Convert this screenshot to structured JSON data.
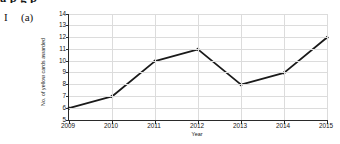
{
  "page": {
    "question_number": "I",
    "question_part": "(a)",
    "top_cut_text": "a  p  g             p"
  },
  "chart_data": {
    "type": "line",
    "title": "",
    "xlabel": "Year",
    "ylabel": "No. of yellow cards awarded",
    "categories": [
      "2009",
      "2010",
      "2011",
      "2012",
      "2013",
      "2014",
      "2015"
    ],
    "x": [
      2009,
      2010,
      2011,
      2012,
      2013,
      2014,
      2015
    ],
    "values": [
      6,
      7,
      10,
      11,
      8,
      9,
      12
    ],
    "series": [
      {
        "name": "No. of yellow cards awarded",
        "values": [
          6,
          7,
          10,
          11,
          8,
          9,
          12
        ]
      }
    ],
    "ylim": [
      5,
      14
    ],
    "xlim": [
      2009,
      2015
    ],
    "ytick_labels": [
      "5",
      "6",
      "7",
      "8",
      "9",
      "10",
      "11",
      "12",
      "13",
      "14"
    ],
    "yticks": [
      5,
      6,
      7,
      8,
      9,
      10,
      11,
      12,
      13,
      14
    ],
    "xtick_labels": [
      "2009",
      "2010",
      "2011",
      "2012",
      "2013",
      "2014",
      "2015"
    ],
    "grid": true,
    "legend": "none",
    "marker": "diamond",
    "line_color": "#1a1a1a",
    "grid_color": "#dcdcdc",
    "axis_color": "#2a2a2a"
  }
}
